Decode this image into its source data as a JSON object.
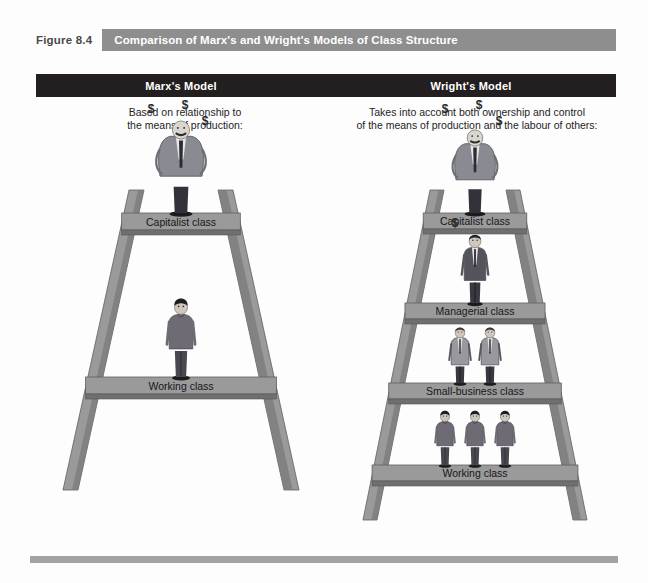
{
  "figure": {
    "number_label": "Figure 8.4",
    "title": "Comparison of Marx's and Wright's Models of Class Structure"
  },
  "colors": {
    "title_banner_bg": "#8e8e8e",
    "model_bar_bg": "#231f20",
    "ladder_rail": "#9a9a9a",
    "ladder_rail_shade": "#7e7e7e",
    "rung_face": "#9a9a9a",
    "rung_edge": "#6f6f6f",
    "page_bg": "#fdfdfd",
    "bottom_rule": "#a3a3a3",
    "text_dark": "#16161a",
    "text_light": "#ffffff"
  },
  "models": [
    {
      "id": "marx",
      "header": "Marx's Model",
      "subtitle_line1": "Based on relationship to",
      "subtitle_line2": "the means of production:",
      "rungs": [
        {
          "label": "Capitalist class",
          "figure_count": 1,
          "figure_type": "capitalist",
          "dollar_signs": [
            "$",
            "$",
            "$"
          ]
        },
        {
          "label": "Working class",
          "figure_count": 1,
          "figure_type": "worker",
          "dollar_signs": []
        }
      ]
    },
    {
      "id": "wright",
      "header": "Wright's Model",
      "subtitle_line1": "Takes into account both ownership and control",
      "subtitle_line2": "of the means of production and the labour of others:",
      "rungs": [
        {
          "label": "Capitalist class",
          "figure_count": 1,
          "figure_type": "capitalist",
          "dollar_signs": [
            "$",
            "$",
            "$"
          ]
        },
        {
          "label": "Managerial class",
          "figure_count": 1,
          "figure_type": "manager",
          "dollar_signs": [
            "$"
          ]
        },
        {
          "label": "Small-business class",
          "figure_count": 2,
          "figure_type": "smallbusiness",
          "dollar_signs": []
        },
        {
          "label": "Working class",
          "figure_count": 3,
          "figure_type": "worker",
          "dollar_signs": []
        }
      ]
    }
  ]
}
